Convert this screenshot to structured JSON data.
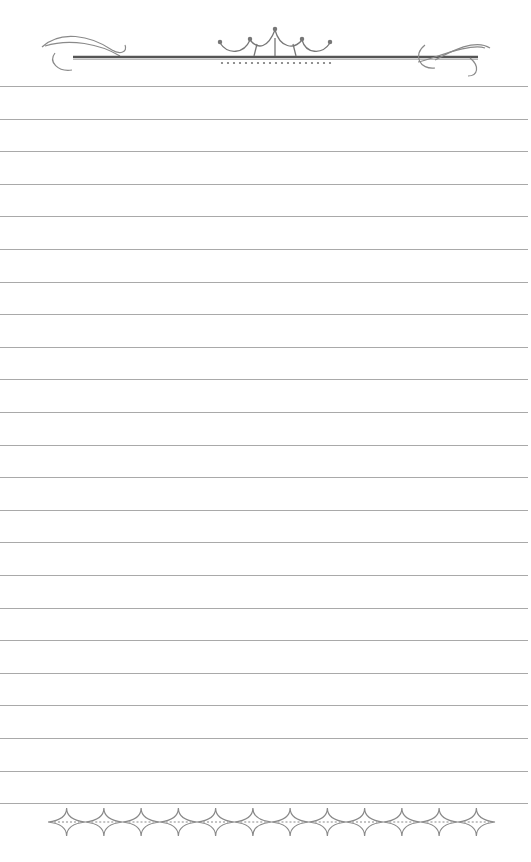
{
  "page": {
    "type": "decorative-lined-paper",
    "background": "#ffffff",
    "line_color": "#9a9a9a",
    "ornament_color": "#7a7a7a"
  },
  "header": {
    "ornament": "crown-with-scrolls-icon",
    "left_flourish": "scroll-flourish-icon",
    "right_flourish": "scroll-flourish-icon"
  },
  "lines": {
    "count": 23,
    "first_y": 86,
    "spacing": 32.6
  },
  "footer": {
    "ornament": "diamond-chain-border-icon",
    "diamond_count": 12
  }
}
